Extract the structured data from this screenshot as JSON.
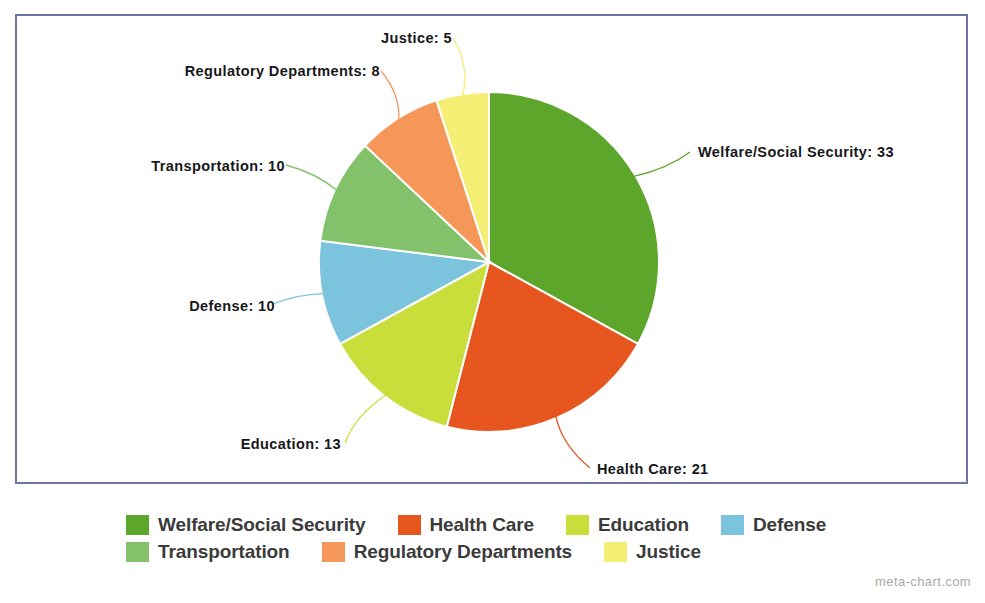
{
  "frame": {
    "border_color": "#6d74a9"
  },
  "chart_data": {
    "type": "pie",
    "title": "",
    "subtitle": "",
    "xlabel": "",
    "ylabel": "",
    "total": 100,
    "start_angle_deg": 0,
    "direction": "clockwise",
    "legend_position": "bottom",
    "grid": false,
    "categories": [
      "Welfare/Social Security",
      "Health Care",
      "Education",
      "Defense",
      "Transportation",
      "Regulatory Departments",
      "Justice"
    ],
    "values": [
      33,
      21,
      13,
      10,
      10,
      8,
      5
    ],
    "colors": [
      "#5ba62b",
      "#e85620",
      "#c9dd3b",
      "#7cc4dd",
      "#84c16b",
      "#f6975a",
      "#f5ee74"
    ],
    "slices": [
      {
        "label": "Welfare/Social Security",
        "value": 33,
        "color": "#5ba62b",
        "callout": "Welfare/Social Security: 33",
        "side": "right"
      },
      {
        "label": "Health Care",
        "value": 21,
        "color": "#e85620",
        "callout": "Health Care: 21",
        "side": "right"
      },
      {
        "label": "Education",
        "value": 13,
        "color": "#c9dd3b",
        "callout": "Education: 13",
        "side": "left"
      },
      {
        "label": "Defense",
        "value": 10,
        "color": "#7cc4dd",
        "callout": "Defense: 10",
        "side": "left"
      },
      {
        "label": "Transportation",
        "value": 10,
        "color": "#84c16b",
        "callout": "Transportation: 10",
        "side": "left"
      },
      {
        "label": "Regulatory Departments",
        "value": 8,
        "color": "#f6975a",
        "callout": "Regulatory Departments: 8",
        "side": "left"
      },
      {
        "label": "Justice",
        "value": 5,
        "color": "#f5ee74",
        "callout": "Justice: 5",
        "side": "left"
      }
    ]
  },
  "legend": {
    "rows": [
      [
        {
          "label": "Welfare/Social Security",
          "color": "#5ba62b"
        },
        {
          "label": "Health Care",
          "color": "#e85620"
        },
        {
          "label": "Education",
          "color": "#c9dd3b"
        },
        {
          "label": "Defense",
          "color": "#7cc4dd"
        }
      ],
      [
        {
          "label": "Transportation",
          "color": "#84c16b"
        },
        {
          "label": "Regulatory Departments",
          "color": "#f6975a"
        },
        {
          "label": "Justice",
          "color": "#f5ee74"
        }
      ]
    ]
  },
  "watermark": {
    "text": "meta-chart.com"
  }
}
